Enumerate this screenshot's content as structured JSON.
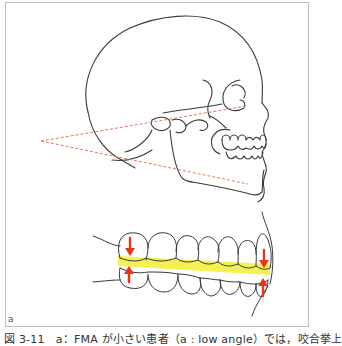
{
  "figure": {
    "panel_label": "a",
    "caption": "図 3-11　a：FMA が小さい患者（a : low angle）では，咬合挙上",
    "colors": {
      "outline": "#3a3a3a",
      "angle_lines": "#e07a5f",
      "occlusal_band": "#f2f044",
      "arrows": "#e8341c",
      "frame": "#bdbdbd"
    },
    "elements": {
      "skull": "lateral skull outline with mandible",
      "fma_angle": "dashed angle formed by Frankfort horizontal plane and mandibular plane (low angle)",
      "dentition": "lateral view of upper and lower teeth with highlighted occlusal plane",
      "arrows": [
        "up-down arrows at molar region",
        "up-down arrows at incisor region"
      ]
    }
  }
}
